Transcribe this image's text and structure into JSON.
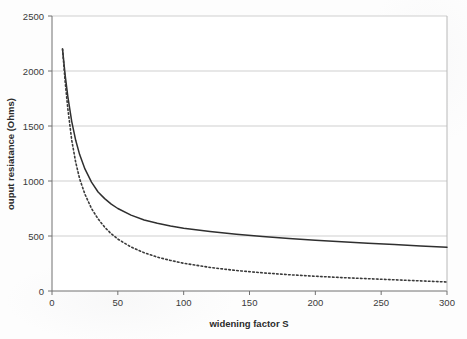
{
  "chart_data": {
    "type": "line",
    "title": "",
    "xlabel": "widening factor S",
    "ylabel": "ouput resiatance (Ohms)",
    "xlim": [
      0,
      300
    ],
    "ylim": [
      0,
      2500
    ],
    "xticks": [
      "0",
      "50",
      "100",
      "150",
      "200",
      "250",
      "300"
    ],
    "yticks": [
      "0",
      "500",
      "1000",
      "1500",
      "2000",
      "2500"
    ],
    "xtick_values": [
      0,
      50,
      100,
      150,
      200,
      250,
      300
    ],
    "ytick_values": [
      0,
      500,
      1000,
      1500,
      2000,
      2500
    ],
    "grid": "horizontal",
    "legend": "none",
    "series": [
      {
        "name": "solid-curve",
        "style": "solid",
        "color": "#2f2f2f",
        "x": [
          8,
          10,
          12,
          15,
          18,
          21,
          25,
          30,
          35,
          40,
          45,
          50,
          60,
          70,
          80,
          90,
          100,
          120,
          140,
          160,
          180,
          200,
          220,
          240,
          260,
          280,
          300
        ],
        "y": [
          2200,
          1960,
          1770,
          1540,
          1370,
          1240,
          1110,
          990,
          900,
          840,
          790,
          750,
          690,
          645,
          615,
          590,
          570,
          540,
          515,
          495,
          478,
          462,
          448,
          434,
          422,
          410,
          398
        ]
      },
      {
        "name": "dotted-curve",
        "style": "dotted",
        "color": "#3a3a3a",
        "x": [
          8,
          10,
          12,
          15,
          18,
          21,
          25,
          30,
          35,
          40,
          45,
          50,
          60,
          70,
          80,
          90,
          100,
          120,
          140,
          160,
          180,
          200,
          220,
          240,
          260,
          280,
          300
        ],
        "y": [
          2200,
          1900,
          1660,
          1370,
          1170,
          1020,
          880,
          750,
          655,
          580,
          520,
          472,
          400,
          348,
          308,
          278,
          252,
          214,
          186,
          165,
          148,
          134,
          122,
          112,
          102,
          92,
          82
        ]
      }
    ]
  },
  "axis": {
    "x_title": "widening factor S",
    "y_title": "ouput resiatance (Ohms)"
  }
}
